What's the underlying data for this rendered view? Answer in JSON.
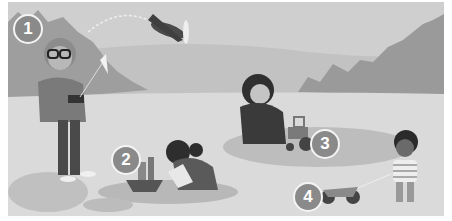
{
  "illustration": {
    "description": "Children and an adult playing with toys in a park",
    "labels": [
      {
        "number": "1",
        "subject": "toy plane"
      },
      {
        "number": "2",
        "subject": "toy boat"
      },
      {
        "number": "3",
        "subject": "toy tractor"
      },
      {
        "number": "4",
        "subject": "toy motorbike"
      }
    ]
  },
  "colors": {
    "sky": "#cfcfcf",
    "hill": "#bdbdbd",
    "trees": "#9a9a9a",
    "ground": "#dcdcdc",
    "shadow": "#b5b5b5",
    "badge": "#8a8a8a"
  }
}
